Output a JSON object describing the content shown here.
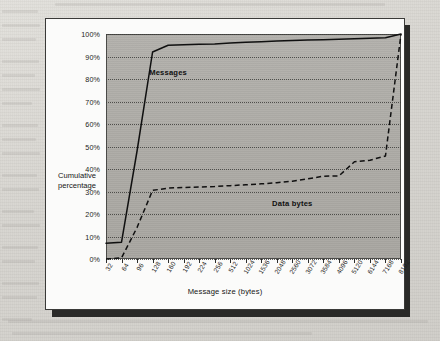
{
  "chart_data": {
    "type": "line",
    "title": "",
    "xlabel": "Message size (bytes)",
    "ylabel": "Cumulative percentage",
    "grid": true,
    "legend_position": "inline-annotation",
    "ylim": [
      0,
      100
    ],
    "ytick_labels": [
      "100%",
      "90%",
      "80%",
      "70%",
      "60%",
      "50%",
      "40%",
      "30%",
      "20%",
      "10%",
      "0%"
    ],
    "ytick_values": [
      100,
      90,
      80,
      70,
      60,
      50,
      40,
      30,
      20,
      10,
      0
    ],
    "categories": [
      "32",
      "64",
      "96",
      "128",
      "160",
      "192",
      "224",
      "256",
      "512",
      "1024",
      "1536",
      "2048",
      "2560",
      "3072",
      "3584",
      "4096",
      "5120",
      "6144",
      "7168",
      "8192"
    ],
    "series": [
      {
        "name": "Messages",
        "style": "solid",
        "values": [
          7,
          7.5,
          48,
          92,
          95,
          95.2,
          95.4,
          95.6,
          96,
          96.3,
          96.6,
          96.9,
          97.1,
          97.3,
          97.5,
          97.7,
          97.9,
          98.1,
          98.3,
          100
        ]
      },
      {
        "name": "Data bytes",
        "style": "dashed",
        "values": [
          0,
          0.5,
          14,
          30.5,
          31.5,
          31.8,
          32,
          32.2,
          32.6,
          33,
          33.4,
          33.9,
          34.6,
          35.6,
          36.8,
          36.9,
          43.2,
          43.9,
          45.8,
          100
        ]
      }
    ],
    "annotations": [
      {
        "text": "Messages",
        "category": "160",
        "value": 83
      },
      {
        "text": "Data bytes",
        "category": "2560",
        "value": 25
      }
    ]
  },
  "axes": {
    "y_title_line1": "Cumulative",
    "y_title_line2": "percentage",
    "x_title": "Message size (bytes)"
  },
  "colors": {
    "page_background": "#d9d7d2",
    "figure_background": "#fbfbfa",
    "plot_fill": "#aeaca7",
    "line": "#101010",
    "grid": "#3e3e3b",
    "text": "#151514"
  }
}
